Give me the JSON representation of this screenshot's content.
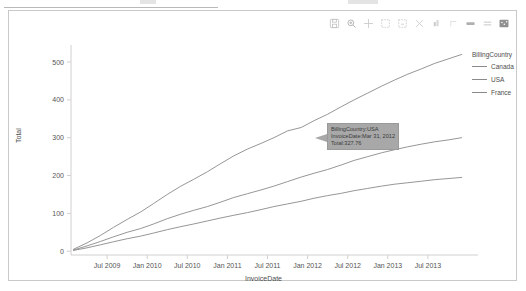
{
  "toolbar": {
    "items": [
      {
        "name": "save-icon",
        "label": "Save"
      },
      {
        "name": "zoom-in-icon",
        "label": "Zoom"
      },
      {
        "name": "move-icon",
        "label": "Pan"
      },
      {
        "name": "box-select-icon",
        "label": "Box Select"
      },
      {
        "name": "lasso-select-icon",
        "label": "Lasso Select"
      },
      {
        "name": "reset-axes-icon",
        "label": "Reset axes"
      },
      {
        "name": "autoscale-icon",
        "label": "Autoscale"
      },
      {
        "name": "spike-lines-icon",
        "label": "Toggle Spike Lines"
      },
      {
        "name": "hover-compare-icon",
        "label": "Compare data on hover"
      },
      {
        "name": "hover-closest-icon",
        "label": "Show closest data on hover"
      },
      {
        "name": "logo-icon",
        "label": "Produced with Plotly"
      }
    ]
  },
  "legend": {
    "title": "BillingCountry",
    "entries": [
      {
        "label": "Canada",
        "color": "#8a8a8a"
      },
      {
        "label": "USA",
        "color": "#8a8a8a"
      },
      {
        "label": "France",
        "color": "#8a8a8a"
      }
    ]
  },
  "tooltip": {
    "lines": [
      "BillingCountry:USA",
      "InvoiceDate:Mar 31, 2012",
      "Total:327.76"
    ]
  },
  "chart_data": {
    "type": "line",
    "title": "",
    "xlabel": "InvoiceDate",
    "ylabel": "Total",
    "grid": false,
    "legend_position": "right",
    "ylim": [
      -10,
      545
    ],
    "yticks": [
      "0",
      "100",
      "200",
      "300",
      "400",
      "500"
    ],
    "ytick_values": [
      0,
      100,
      200,
      300,
      400,
      500
    ],
    "xticks": [
      "Jul 2009",
      "Jan 2010",
      "Jul 2010",
      "Jan 2011",
      "Jul 2011",
      "Jan 2012",
      "Jul 2012",
      "Jan 2013",
      "Jul 2013"
    ],
    "xtick_values": [
      2009.5,
      2010.0,
      2010.5,
      2011.0,
      2011.5,
      2012.0,
      2012.5,
      2013.0,
      2013.5
    ],
    "xlim": [
      2009.05,
      2013.95
    ],
    "series": [
      {
        "name": "USA",
        "color": "#8a8a8a",
        "x": [
          2009.08,
          2009.25,
          2009.42,
          2009.58,
          2009.75,
          2009.92,
          2010.08,
          2010.25,
          2010.42,
          2010.58,
          2010.75,
          2010.92,
          2011.08,
          2011.25,
          2011.42,
          2011.58,
          2011.75,
          2011.92,
          2012.08,
          2012.25,
          2012.42,
          2012.58,
          2012.75,
          2012.92,
          2013.08,
          2013.25,
          2013.42,
          2013.58,
          2013.75,
          2013.92
        ],
        "y": [
          5,
          22,
          42,
          63,
          84,
          104,
          126,
          150,
          172,
          190,
          210,
          232,
          252,
          270,
          285,
          300,
          318,
          327,
          345,
          362,
          382,
          400,
          418,
          436,
          452,
          468,
          482,
          496,
          508,
          520
        ]
      },
      {
        "name": "Canada",
        "color": "#8a8a8a",
        "x": [
          2009.08,
          2009.25,
          2009.42,
          2009.58,
          2009.75,
          2009.92,
          2010.08,
          2010.25,
          2010.42,
          2010.58,
          2010.75,
          2010.92,
          2011.08,
          2011.25,
          2011.42,
          2011.58,
          2011.75,
          2011.92,
          2012.08,
          2012.25,
          2012.42,
          2012.58,
          2012.75,
          2012.92,
          2013.08,
          2013.25,
          2013.42,
          2013.58,
          2013.75,
          2013.92
        ],
        "y": [
          3,
          14,
          26,
          38,
          50,
          60,
          72,
          86,
          98,
          108,
          118,
          130,
          142,
          152,
          162,
          172,
          184,
          196,
          206,
          216,
          228,
          240,
          250,
          260,
          268,
          276,
          283,
          289,
          294,
          300
        ]
      },
      {
        "name": "France",
        "color": "#8a8a8a",
        "x": [
          2009.08,
          2009.25,
          2009.42,
          2009.58,
          2009.75,
          2009.92,
          2010.08,
          2010.25,
          2010.42,
          2010.58,
          2010.75,
          2010.92,
          2011.08,
          2011.25,
          2011.42,
          2011.58,
          2011.75,
          2011.92,
          2012.08,
          2012.25,
          2012.42,
          2012.58,
          2012.75,
          2012.92,
          2013.08,
          2013.25,
          2013.42,
          2013.58,
          2013.75,
          2013.92
        ],
        "y": [
          2,
          9,
          17,
          25,
          33,
          40,
          48,
          57,
          65,
          72,
          80,
          88,
          95,
          102,
          110,
          118,
          125,
          132,
          140,
          147,
          153,
          160,
          166,
          172,
          177,
          181,
          185,
          189,
          192,
          195
        ]
      }
    ]
  }
}
